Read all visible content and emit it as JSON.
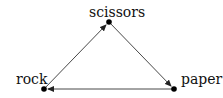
{
  "diagram": {
    "title": "",
    "nodes": [
      {
        "id": "rock",
        "label": "rock",
        "x": 44,
        "y": 89,
        "label_x": 16,
        "label_y": 84
      },
      {
        "id": "scissors",
        "label": "scissors",
        "x": 109,
        "y": 22,
        "label_x": 89,
        "label_y": 17
      },
      {
        "id": "paper",
        "label": "paper",
        "x": 174,
        "y": 89,
        "label_x": 181,
        "label_y": 84
      }
    ],
    "edges": [
      {
        "from": "rock",
        "to": "scissors"
      },
      {
        "from": "scissors",
        "to": "paper"
      },
      {
        "from": "paper",
        "to": "rock"
      }
    ],
    "colors": {
      "node": "#000000",
      "edge": "#333333",
      "text": "#111111"
    }
  }
}
